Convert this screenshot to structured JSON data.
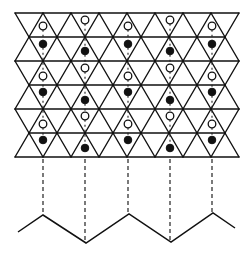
{
  "figure": {
    "colors": {
      "line": "#111111",
      "background": "#ffffff",
      "open_atom_fill": "#ffffff",
      "filled_atom_fill": "#111111"
    },
    "lattice": {
      "row_lines_y": [
        13,
        37,
        61,
        85,
        109,
        133,
        157
      ],
      "triangle_side": 28,
      "even_line_x_start": 15,
      "even_line_x_end": 239,
      "odd_line_x_start": 29,
      "odd_line_x_end": 225
    },
    "atom_radius": 3.8,
    "columns": [
      {
        "x": 43,
        "atoms": [
          {
            "y": 26,
            "type": "open"
          },
          {
            "y": 44,
            "type": "filled"
          },
          {
            "y": 76,
            "type": "open"
          },
          {
            "y": 92,
            "type": "filled"
          },
          {
            "y": 124,
            "type": "open"
          },
          {
            "y": 140,
            "type": "filled"
          }
        ]
      },
      {
        "x": 85,
        "atoms": [
          {
            "y": 20,
            "type": "open"
          },
          {
            "y": 51,
            "type": "filled"
          },
          {
            "y": 68,
            "type": "open"
          },
          {
            "y": 100,
            "type": "filled"
          },
          {
            "y": 116,
            "type": "open"
          },
          {
            "y": 148,
            "type": "filled"
          }
        ]
      },
      {
        "x": 128,
        "atoms": [
          {
            "y": 26,
            "type": "open"
          },
          {
            "y": 44,
            "type": "filled"
          },
          {
            "y": 76,
            "type": "open"
          },
          {
            "y": 92,
            "type": "filled"
          },
          {
            "y": 124,
            "type": "open"
          },
          {
            "y": 140,
            "type": "filled"
          }
        ]
      },
      {
        "x": 170,
        "atoms": [
          {
            "y": 20,
            "type": "open"
          },
          {
            "y": 51,
            "type": "filled"
          },
          {
            "y": 68,
            "type": "open"
          },
          {
            "y": 100,
            "type": "filled"
          },
          {
            "y": 116,
            "type": "open"
          },
          {
            "y": 148,
            "type": "filled"
          }
        ]
      },
      {
        "x": 212,
        "atoms": [
          {
            "y": 26,
            "type": "open"
          },
          {
            "y": 44,
            "type": "filled"
          },
          {
            "y": 76,
            "type": "open"
          },
          {
            "y": 92,
            "type": "filled"
          },
          {
            "y": 124,
            "type": "open"
          },
          {
            "y": 140,
            "type": "filled"
          }
        ]
      }
    ],
    "projection": {
      "start_y": 159,
      "ends": [
        {
          "x": 43,
          "y": 215
        },
        {
          "x": 85,
          "y": 243
        },
        {
          "x": 128,
          "y": 214
        },
        {
          "x": 170,
          "y": 242
        },
        {
          "x": 212,
          "y": 213
        }
      ]
    },
    "zigzag_points": [
      [
        18,
        232
      ],
      [
        43,
        215
      ],
      [
        86,
        243
      ],
      [
        129,
        214
      ],
      [
        171,
        242
      ],
      [
        213,
        213
      ],
      [
        235,
        228
      ]
    ]
  }
}
